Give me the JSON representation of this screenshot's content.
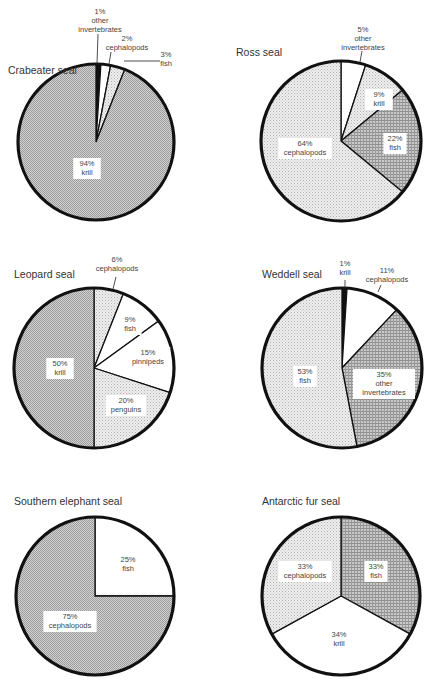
{
  "chart_data": [
    {
      "type": "pie",
      "title": "Crabeater seal",
      "center": [
        96,
        142
      ],
      "radius": 78,
      "slices": [
        {
          "label": "other invertebrates",
          "value": 1,
          "fill": "black",
          "text": [
            "1%",
            "other",
            "invertebrates"
          ],
          "external": true,
          "label_pos": [
            100,
            14
          ],
          "leader": [
            [
              98,
              34
            ],
            [
              97,
              64
            ]
          ]
        },
        {
          "label": "cephalopods",
          "value": 2,
          "fill": "white",
          "text": [
            "2%",
            "cephalopods"
          ],
          "external": true,
          "label_pos": [
            127,
            41
          ],
          "leader": [
            [
              111,
              52
            ],
            [
              109,
              64
            ]
          ]
        },
        {
          "label": "fish",
          "value": 3,
          "fill": "light",
          "text": [
            "3%",
            "fish"
          ],
          "external": true,
          "label_pos": [
            166,
            57
          ],
          "leader": [
            [
              124,
              61
            ],
            [
              160,
              61
            ]
          ]
        },
        {
          "label": "krill",
          "value": 94,
          "fill": "medium",
          "text": [
            "94%",
            "krill"
          ],
          "external": false,
          "label_pos": [
            87,
            166
          ]
        }
      ]
    },
    {
      "type": "pie",
      "title": "Ross seal",
      "center": [
        341,
        141
      ],
      "radius": 80,
      "slices": [
        {
          "label": "other invertebrates",
          "value": 5,
          "fill": "white",
          "text": [
            "5%",
            "other",
            "invertebrates"
          ],
          "external": true,
          "label_pos": [
            363,
            32
          ],
          "leader": [
            [
              362,
              51
            ],
            [
              360,
              62
            ]
          ]
        },
        {
          "label": "krill",
          "value": 9,
          "fill": "light",
          "text": [
            "9%",
            "krill"
          ],
          "external": false,
          "label_pos": [
            379,
            97
          ]
        },
        {
          "label": "fish",
          "value": 22,
          "fill": "dark",
          "text": [
            "22%",
            "fish"
          ],
          "external": false,
          "label_pos": [
            395,
            141
          ]
        },
        {
          "label": "cephalopods",
          "value": 64,
          "fill": "light",
          "text": [
            "64%",
            "cephalopods"
          ],
          "external": false,
          "label_pos": [
            305,
            146
          ]
        }
      ]
    },
    {
      "type": "pie",
      "title": "Leopard seal",
      "center": [
        94,
        368
      ],
      "radius": 80,
      "slices": [
        {
          "label": "cephalopods",
          "value": 6,
          "fill": "light",
          "text": [
            "6%",
            "cephalopods"
          ],
          "external": true,
          "label_pos": [
            117,
            262
          ],
          "leader": [
            [
              116,
              277
            ],
            [
              113,
              289
            ]
          ]
        },
        {
          "label": "fish",
          "value": 9,
          "fill": "white",
          "text": [
            "9%",
            "fish"
          ],
          "external": false,
          "label_pos": [
            130,
            322
          ]
        },
        {
          "label": "pinnipeds",
          "value": 15,
          "fill": "white",
          "text": [
            "15%",
            "pinnipeds"
          ],
          "external": false,
          "label_pos": [
            148,
            355
          ]
        },
        {
          "label": "penguins",
          "value": 20,
          "fill": "light",
          "text": [
            "20%",
            "penguins"
          ],
          "external": false,
          "label_pos": [
            126,
            403
          ]
        },
        {
          "label": "krill",
          "value": 50,
          "fill": "medium",
          "text": [
            "50%",
            "krill"
          ],
          "external": false,
          "label_pos": [
            60,
            366
          ]
        }
      ]
    },
    {
      "type": "pie",
      "title": "Weddell seal",
      "center": [
        342,
        368
      ],
      "radius": 80,
      "slices": [
        {
          "label": "krill",
          "value": 1,
          "fill": "black",
          "text": [
            "1%",
            "krill"
          ],
          "external": true,
          "label_pos": [
            345,
            266
          ],
          "leader": [
            [
              345,
              280
            ],
            [
              345,
              288
            ]
          ]
        },
        {
          "label": "cephalopods",
          "value": 11,
          "fill": "white",
          "text": [
            "11%",
            "cephalopods"
          ],
          "external": true,
          "label_pos": [
            387,
            273
          ],
          "leader": [
            [
              381,
              285
            ],
            [
              378,
              292
            ]
          ]
        },
        {
          "label": "other invertebrates",
          "value": 35,
          "fill": "dark",
          "text": [
            "35%",
            "other",
            "invertebrates"
          ],
          "external": false,
          "label_pos": [
            384,
            377
          ]
        },
        {
          "label": "fish",
          "value": 53,
          "fill": "light",
          "text": [
            "53%",
            "fish"
          ],
          "external": false,
          "label_pos": [
            305,
            374
          ]
        }
      ]
    },
    {
      "type": "pie",
      "title": "Southern elephant seal",
      "center": [
        95,
        596
      ],
      "radius": 79,
      "slices": [
        {
          "label": "fish",
          "value": 25,
          "fill": "white",
          "text": [
            "25%",
            "fish"
          ],
          "external": false,
          "label_pos": [
            128,
            562
          ]
        },
        {
          "label": "cephalopods",
          "value": 75,
          "fill": "medium",
          "text": [
            "75%",
            "cephalopods"
          ],
          "external": false,
          "label_pos": [
            70,
            619
          ]
        }
      ]
    },
    {
      "type": "pie",
      "title": "Antarctic fur seal",
      "center": [
        341,
        596
      ],
      "radius": 79,
      "slices": [
        {
          "label": "fish",
          "value": 33,
          "fill": "dark",
          "text": [
            "33%",
            "fish"
          ],
          "external": false,
          "label_pos": [
            376,
            569
          ]
        },
        {
          "label": "krill",
          "value": 34,
          "fill": "white",
          "text": [
            "34%",
            "krill"
          ],
          "external": false,
          "label_pos": [
            339,
            637
          ]
        },
        {
          "label": "cephalopods",
          "value": 33,
          "fill": "light",
          "text": [
            "33%",
            "cephalopods"
          ],
          "external": false,
          "label_pos": [
            305,
            569
          ]
        }
      ]
    }
  ],
  "titles": {
    "crabeater": "Crabeater seal",
    "ross": "Ross seal",
    "leopard": "Leopard seal",
    "weddell": "Weddell seal",
    "elephant": "Southern elephant seal",
    "fur": "Antarctic fur seal"
  },
  "title_positions": [
    [
      8,
      74
    ],
    [
      236,
      56
    ],
    [
      14,
      278
    ],
    [
      262,
      278
    ],
    [
      14,
      505
    ],
    [
      262,
      505
    ]
  ],
  "colors": {
    "black": "#111111",
    "white": "#ffffff",
    "light": "#dcdcdc",
    "medium": "#b8b8b8",
    "dark": "#a4a4a4",
    "outline": "#111111"
  }
}
